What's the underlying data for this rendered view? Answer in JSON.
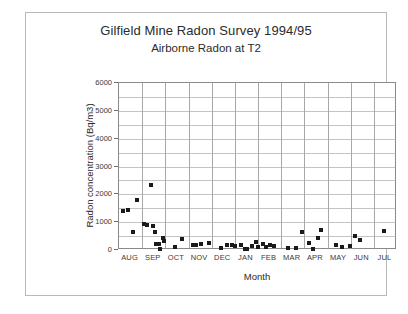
{
  "figure": {
    "title": "Gilfield Mine Radon Survey 1994/95",
    "subtitle": "Airborne Radon at T2"
  },
  "chart_data": {
    "type": "scatter",
    "title": "Gilfield Mine Radon Survey 1994/95",
    "subtitle": "Airborne Radon at T2",
    "xlabel": "Month",
    "ylabel": "Radon concentration  (Bq/m3)",
    "ylim": [
      0,
      6000
    ],
    "ytick_labels": [
      "0",
      "1000",
      "2000",
      "3000",
      "4000",
      "5000",
      "6000"
    ],
    "ytick_values": [
      0,
      1000,
      2000,
      3000,
      4000,
      5000,
      6000
    ],
    "ygrid_minor_step": 500,
    "grid": true,
    "legend": null,
    "categories": [
      "AUG",
      "SEP",
      "OCT",
      "NOV",
      "DEC",
      "JAN",
      "FEB",
      "MAR",
      "APR",
      "MAY",
      "JUN",
      "JUL"
    ],
    "xlim": [
      0,
      12
    ],
    "points": [
      {
        "x": 0.18,
        "y": 1400
      },
      {
        "x": 0.4,
        "y": 1430
      },
      {
        "x": 0.62,
        "y": 640
      },
      {
        "x": 0.78,
        "y": 1800
      },
      {
        "x": 1.08,
        "y": 930
      },
      {
        "x": 1.22,
        "y": 910
      },
      {
        "x": 1.4,
        "y": 2330
      },
      {
        "x": 1.48,
        "y": 880
      },
      {
        "x": 1.55,
        "y": 630
      },
      {
        "x": 1.6,
        "y": 210
      },
      {
        "x": 1.74,
        "y": 230
      },
      {
        "x": 1.78,
        "y": 30
      },
      {
        "x": 1.92,
        "y": 440
      },
      {
        "x": 1.96,
        "y": 330
      },
      {
        "x": 2.4,
        "y": 120
      },
      {
        "x": 2.72,
        "y": 390
      },
      {
        "x": 3.18,
        "y": 170
      },
      {
        "x": 3.34,
        "y": 175
      },
      {
        "x": 3.52,
        "y": 230
      },
      {
        "x": 3.9,
        "y": 265
      },
      {
        "x": 4.42,
        "y": 90
      },
      {
        "x": 4.66,
        "y": 190
      },
      {
        "x": 4.86,
        "y": 195
      },
      {
        "x": 5.02,
        "y": 155
      },
      {
        "x": 5.26,
        "y": 190
      },
      {
        "x": 5.44,
        "y": 40
      },
      {
        "x": 5.52,
        "y": 20
      },
      {
        "x": 5.72,
        "y": 155
      },
      {
        "x": 5.92,
        "y": 275
      },
      {
        "x": 6.0,
        "y": 100
      },
      {
        "x": 6.2,
        "y": 215
      },
      {
        "x": 6.34,
        "y": 115
      },
      {
        "x": 6.5,
        "y": 185
      },
      {
        "x": 6.68,
        "y": 160
      },
      {
        "x": 7.3,
        "y": 55
      },
      {
        "x": 7.62,
        "y": 70
      },
      {
        "x": 7.92,
        "y": 630
      },
      {
        "x": 8.22,
        "y": 240
      },
      {
        "x": 8.38,
        "y": 30
      },
      {
        "x": 8.58,
        "y": 430
      },
      {
        "x": 8.72,
        "y": 710
      },
      {
        "x": 9.36,
        "y": 165
      },
      {
        "x": 9.62,
        "y": 95
      },
      {
        "x": 9.96,
        "y": 145
      },
      {
        "x": 10.18,
        "y": 490
      },
      {
        "x": 10.4,
        "y": 355
      },
      {
        "x": 11.42,
        "y": 665
      }
    ]
  }
}
